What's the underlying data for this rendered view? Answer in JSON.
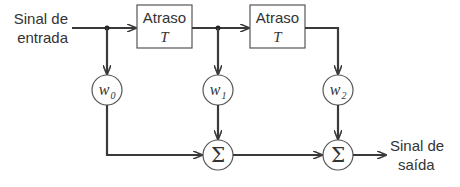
{
  "diagram": {
    "input_label": [
      "Sinal de",
      "entrada"
    ],
    "output_label": [
      "Sinal de",
      "saída"
    ],
    "delay_blocks": [
      {
        "label": "Atraso",
        "symbol": "T"
      },
      {
        "label": "Atraso",
        "symbol": "T"
      }
    ],
    "weights": [
      {
        "symbol": "w",
        "sub": "0"
      },
      {
        "symbol": "w",
        "sub": "1"
      },
      {
        "symbol": "w",
        "sub": "2"
      }
    ],
    "summers": [
      {
        "symbol": "Σ"
      },
      {
        "symbol": "Σ"
      }
    ],
    "colors": {
      "line": "#3a3a3a",
      "text": "#333333",
      "background": "#ffffff"
    }
  }
}
